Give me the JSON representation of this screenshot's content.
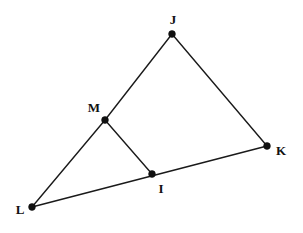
{
  "figure": {
    "type": "geometry-diagram",
    "title": "",
    "canvas": {
      "width": 303,
      "height": 233,
      "background": "#ffffff"
    },
    "style": {
      "line_color": "#1a1a1a",
      "point_color": "#111111",
      "line_width": 1.4,
      "point_radius": 3.4
    },
    "points": [
      {
        "id": "J",
        "label": "J",
        "x": 172,
        "y": 34,
        "label_x": 173,
        "label_y": 19,
        "label_position": "above"
      },
      {
        "id": "K",
        "label": "K",
        "x": 267,
        "y": 146,
        "label_x": 281,
        "label_y": 150,
        "label_position": "right"
      },
      {
        "id": "L",
        "label": "L",
        "x": 32,
        "y": 207,
        "label_x": 20,
        "label_y": 209,
        "label_position": "left"
      },
      {
        "id": "M",
        "label": "M",
        "x": 105,
        "y": 120,
        "label_x": 94,
        "label_y": 107,
        "label_position": "upper-left"
      },
      {
        "id": "I",
        "label": "I",
        "x": 152,
        "y": 174,
        "label_x": 161,
        "label_y": 188,
        "label_position": "below"
      }
    ],
    "segments": [
      {
        "id": "JM",
        "from": "J",
        "to": "M",
        "x1": 172,
        "y1": 34,
        "x2": 105,
        "y2": 120
      },
      {
        "id": "JK",
        "from": "J",
        "to": "K",
        "x1": 172,
        "y1": 34,
        "x2": 267,
        "y2": 146
      },
      {
        "id": "ML",
        "from": "M",
        "to": "L",
        "x1": 105,
        "y1": 120,
        "x2": 32,
        "y2": 207
      },
      {
        "id": "MI",
        "from": "M",
        "to": "I",
        "x1": 105,
        "y1": 120,
        "x2": 152,
        "y2": 174
      },
      {
        "id": "LK",
        "from": "L",
        "to": "K",
        "x1": 32,
        "y1": 207,
        "x2": 267,
        "y2": 146
      }
    ]
  }
}
